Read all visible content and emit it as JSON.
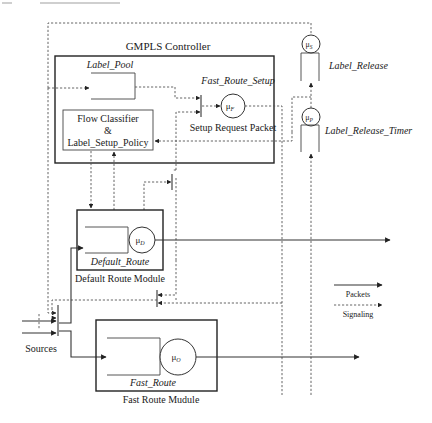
{
  "diagram": {
    "title": "GMPLS Controller",
    "components": {
      "label_pool": "Label_Pool",
      "fast_route_setup": "Fast_Route_Setup",
      "setup_request_packet": "Setup Request Packet",
      "flow_classifier_line1": "Flow Classifier",
      "flow_classifier_line2": "&",
      "flow_classifier_line3": "Label_Setup_Policy",
      "default_route_queue": "Default_Route",
      "default_route_module": "Default Route Module",
      "fast_route_queue": "Fast_Route",
      "fast_route_module": "Fast Route Mudule",
      "label_release": "Label_Release",
      "label_release_timer": "Label_Release_Timer",
      "sources": "Sources"
    },
    "servers": {
      "mu_f": {
        "base": "μ",
        "sub": "F"
      },
      "mu_d": {
        "base": "μ",
        "sub": "D"
      },
      "mu_o": {
        "base": "μ",
        "sub": "O"
      },
      "mu_s": {
        "base": "μ",
        "sub": "S"
      },
      "mu_p": {
        "base": "μ",
        "sub": "P"
      }
    },
    "legend": {
      "packets": "Packets",
      "signaling": "Signaling"
    }
  }
}
